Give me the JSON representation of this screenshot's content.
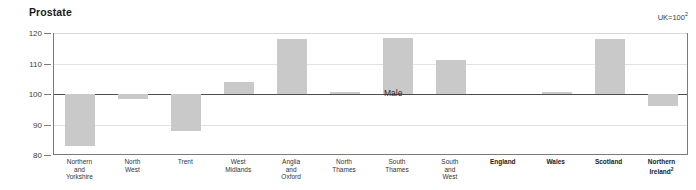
{
  "chart_data": {
    "type": "bar",
    "title": "Prostate",
    "subtitle": "",
    "note": "UK=100",
    "note_superscript": "2",
    "annotation": "Male",
    "xlabel": "",
    "ylabel": "",
    "ylim": [
      80,
      120
    ],
    "yticks": [
      80,
      90,
      100,
      110,
      120
    ],
    "baseline": 100,
    "grid": true,
    "legend": "none",
    "bar_color": "#c9c9c9",
    "categories": [
      "Northern\nand\nYorkshire",
      "North\nWest",
      "Trent",
      "West\nMidlands",
      "Anglia\nand\nOxford",
      "North\nThames",
      "South\nThames",
      "South\nand\nWest",
      "England",
      "Wales",
      "Scotland",
      "Northern\nIreland"
    ],
    "category_bold": [
      false,
      false,
      false,
      false,
      false,
      false,
      false,
      false,
      true,
      true,
      true,
      true
    ],
    "category_superscripts": [
      "",
      "",
      "",
      "",
      "",
      "",
      "",
      "",
      "",
      "",
      "",
      "2"
    ],
    "values": [
      83.0,
      98.3,
      88.0,
      104.0,
      118.0,
      100.5,
      118.2,
      111.0,
      100.0,
      100.8,
      118.0,
      96.0
    ]
  },
  "axis": {
    "ytick_labels": [
      "120",
      "110",
      "100",
      "90",
      "80"
    ]
  }
}
